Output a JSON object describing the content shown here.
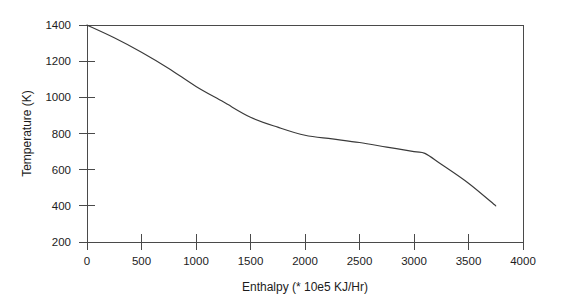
{
  "chart_data": {
    "type": "line",
    "title": "",
    "xlabel": "Enthalpy (* 10e5 KJ/Hr)",
    "ylabel": "Temperature (K)",
    "xlim": [
      0,
      4000
    ],
    "ylim": [
      200,
      1400
    ],
    "grid": false,
    "legend": null,
    "xticks": [
      0,
      500,
      1000,
      1500,
      2000,
      2500,
      3000,
      3500,
      4000
    ],
    "xtick_labels": [
      "0",
      "500",
      "1000",
      "1500",
      "2000",
      "2500",
      "3000",
      "3500",
      "4000"
    ],
    "yticks": [
      200,
      400,
      600,
      800,
      1000,
      1200,
      1400
    ],
    "ytick_labels": [
      "200",
      "400",
      "600",
      "800",
      "1000",
      "1200",
      "1400"
    ],
    "series": [
      {
        "name": "Temperature vs Enthalpy",
        "color": "#3a3a3a",
        "x": [
          0,
          250,
          500,
          750,
          1000,
          1250,
          1500,
          1750,
          2000,
          2250,
          2500,
          2750,
          3000,
          3100,
          3250,
          3500,
          3750
        ],
        "y": [
          1400,
          1330,
          1250,
          1160,
          1060,
          975,
          890,
          835,
          790,
          770,
          750,
          725,
          700,
          690,
          630,
          525,
          400
        ]
      }
    ]
  },
  "axis": {
    "x_title": "Enthalpy (* 10e5 KJ/Hr)",
    "y_title": "Temperature (K)"
  }
}
